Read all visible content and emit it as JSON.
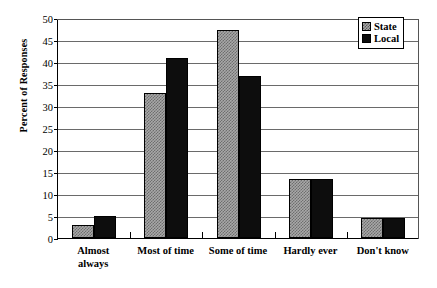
{
  "chart_data": {
    "type": "bar",
    "title": "",
    "xlabel": "",
    "ylabel": "Percent of Responses",
    "ylim": [
      0,
      50
    ],
    "ytick_step": 5,
    "yticks": [
      50,
      45,
      40,
      35,
      30,
      25,
      20,
      15,
      10,
      5,
      0
    ],
    "grid": true,
    "legend_position": "top-right",
    "categories": [
      "Almost always",
      "Most of time",
      "Some of time",
      "Hardly ever",
      "Don't know"
    ],
    "category_lines": [
      [
        "Almost",
        "always"
      ],
      [
        "Most of time"
      ],
      [
        "Some of time"
      ],
      [
        "Hardly ever"
      ],
      [
        "Don't know"
      ]
    ],
    "series": [
      {
        "name": "State",
        "values": [
          3,
          33,
          47.5,
          13.5,
          4.5
        ]
      },
      {
        "name": "Local",
        "values": [
          5,
          41,
          37,
          13.5,
          4.5
        ]
      }
    ]
  },
  "legend": {
    "items": [
      {
        "label": "State",
        "swatch": "hatched-gray"
      },
      {
        "label": "Local",
        "swatch": "solid-black"
      }
    ]
  },
  "caption": ""
}
